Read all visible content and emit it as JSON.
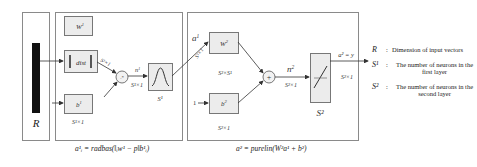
{
  "diagram": {
    "type": "RBF neural network architecture",
    "input": {
      "label": "R"
    },
    "layer1": {
      "weight_label": "W",
      "weight_sup": "1",
      "dist_label": "dist",
      "bias_label": "b",
      "bias_sup": "1",
      "bias_dim": "S¹×1",
      "dist_out_dim": "S¹×1",
      "net_label": "n",
      "net_sup": "1",
      "net_dim": "S¹×1",
      "transfer_label": "S¹",
      "multiply_symbol": ".*",
      "formula": "a¹ᵢ = radbas(‖ᵢw¹ − p‖b¹ᵢ)"
    },
    "layer2": {
      "input_label": "a",
      "input_sup": "1",
      "input_dim": "S¹×1",
      "weight_label": "W",
      "weight_sup": "2",
      "weight_dim": "S²×S¹",
      "bias_input": "1",
      "bias_label": "b",
      "bias_sup": "2",
      "bias_dim": "S²×1",
      "sum_symbol": "+",
      "net_label": "n",
      "net_sup": "2",
      "net_dim": "S²×1",
      "transfer_label": "S²",
      "output_label": "a² = y",
      "output_dim": "S²×1",
      "formula": "a² = purelin(W²a¹ + b²)"
    },
    "legend": [
      {
        "symbol": "R",
        "desc": "Dimension of input vectors"
      },
      {
        "symbol": "S¹",
        "desc": "The number of neurons in the first layer"
      },
      {
        "symbol": "S²",
        "desc": "The number of neurons in the second layer"
      }
    ],
    "colors": {
      "frame": "#8a8a8a",
      "box_fill": "#ececec",
      "box_stroke": "#777777",
      "input_bar": "#111111",
      "arrow": "#333333"
    }
  }
}
